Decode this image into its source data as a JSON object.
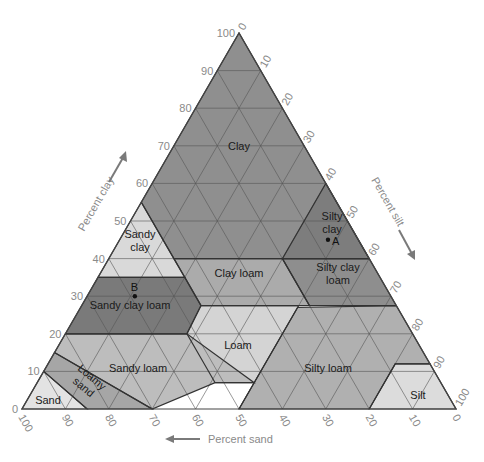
{
  "chart_data": {
    "type": "ternary",
    "title": "",
    "axes": {
      "clay": {
        "label": "Percent clay",
        "direction": "up-left side, arrow upward",
        "ticks": [
          0,
          10,
          20,
          30,
          40,
          50,
          60,
          70,
          80,
          90,
          100
        ]
      },
      "silt": {
        "label": "Percent silt",
        "direction": "right side, arrow downward",
        "ticks": [
          0,
          10,
          20,
          30,
          40,
          50,
          60,
          70,
          80,
          90,
          100
        ]
      },
      "sand": {
        "label": "Percent sand",
        "direction": "bottom, arrow leftward",
        "ticks": [
          100,
          90,
          80,
          70,
          60,
          50,
          40,
          30,
          20,
          10,
          0
        ]
      }
    },
    "grid": true,
    "regions": [
      {
        "name": "Clay",
        "label": "Clay",
        "color": "#8f8f8f",
        "vertices": [
          [
            0,
            0,
            100
          ],
          [
            45,
            0,
            55
          ],
          [
            45,
            15,
            40
          ],
          [
            20,
            40,
            40
          ],
          [
            0,
            60,
            40
          ],
          [
            0,
            0,
            100
          ]
        ],
        "label_pos": [
          30,
          30,
          40
        ],
        "label_at": [
          239,
          146
        ]
      },
      {
        "name": "Sandy clay",
        "label": "Sandy\nclay",
        "color": "#d9d9d9",
        "vertices": [
          [
            45,
            0,
            55
          ],
          [
            65,
            0,
            35
          ],
          [
            45,
            20,
            35
          ],
          [
            45,
            15,
            40
          ]
        ],
        "label_at": [
          140,
          240
        ]
      },
      {
        "name": "Silty clay",
        "label": "Silty\nclay",
        "color": "#7d7d7d",
        "vertices": [
          [
            0,
            60,
            40
          ],
          [
            20,
            40,
            40
          ],
          [
            0,
            40,
            60
          ]
        ],
        "label_at": [
          332,
          222
        ]
      },
      {
        "name": "Sandy clay loam",
        "label": "Sandy clay loam",
        "color": "#7a7a7a",
        "vertices": [
          [
            65,
            0,
            35
          ],
          [
            80,
            0,
            20
          ],
          [
            80,
            0,
            20
          ],
          [
            52,
            28,
            20
          ],
          [
            45,
            27.5,
            27.5
          ],
          [
            45,
            20,
            35
          ]
        ],
        "label_at": [
          130,
          305
        ]
      },
      {
        "name": "Clay loam",
        "label": "Clay loam",
        "color": "#ababab",
        "vertices": [
          [
            45,
            20,
            35
          ],
          [
            45,
            27.5,
            27.5
          ],
          [
            20,
            52.5,
            27.5
          ],
          [
            20,
            40,
            40
          ],
          [
            45,
            15,
            40
          ]
        ],
        "label_at": [
          239,
          273
        ]
      },
      {
        "name": "Silty clay loam",
        "label": "Silty clay\nloam",
        "color": "#8e8e8e",
        "vertices": [
          [
            20,
            40,
            40
          ],
          [
            20,
            52.5,
            27.5
          ],
          [
            0,
            72.5,
            27.5
          ],
          [
            0,
            60,
            40
          ]
        ],
        "label_at": [
          338,
          273
        ]
      },
      {
        "name": "Loam",
        "label": "Loam",
        "color": "#d4d4d4",
        "vertices": [
          [
            52,
            28,
            20
          ],
          [
            45,
            27.5,
            27.5
          ],
          [
            22.5,
            50,
            27.5
          ],
          [
            22.5,
            50,
            27.5
          ],
          [
            23,
            50,
            27
          ],
          [
            50,
            50,
            0
          ],
          [
            43,
            50,
            7
          ],
          [
            52,
            41,
            7
          ]
        ],
        "label_at": [
          238,
          345
        ]
      },
      {
        "name": "Sandy loam",
        "label": "Sandy loam",
        "color": "#bdbdbd",
        "vertices": [
          [
            80,
            0,
            20
          ],
          [
            85,
            0,
            15
          ],
          [
            70,
            30,
            0
          ],
          [
            52,
            41,
            7
          ],
          [
            43,
            50,
            7
          ],
          [
            52,
            28,
            20
          ]
        ],
        "label_at": [
          138,
          368
        ]
      },
      {
        "name": "Silty loam",
        "label": "Silty loam",
        "color": "#b0b0b0",
        "vertices": [
          [
            50,
            50,
            0
          ],
          [
            23,
            50,
            27
          ],
          [
            0,
            72.5,
            27.5
          ],
          [
            0,
            88,
            12
          ],
          [
            8,
            80,
            12
          ],
          [
            20,
            80,
            0
          ]
        ],
        "label_at": [
          328,
          368
        ]
      },
      {
        "name": "Silt",
        "label": "Silt",
        "color": "#dcdcdc",
        "vertices": [
          [
            20,
            80,
            0
          ],
          [
            8,
            80,
            12
          ],
          [
            0,
            88,
            12
          ],
          [
            0,
            100,
            0
          ]
        ],
        "label_at": [
          418,
          395
        ]
      },
      {
        "name": "Loamy sand",
        "label": "Loamy\nsand",
        "color": "#a6a6a6",
        "vertices": [
          [
            85,
            0,
            15
          ],
          [
            90,
            0,
            10
          ],
          [
            85,
            15,
            0
          ],
          [
            70,
            30,
            0
          ]
        ],
        "label_at": [
          88,
          382
        ]
      },
      {
        "name": "Sand",
        "label": "Sand",
        "color": "#e3e3e3",
        "vertices": [
          [
            90,
            0,
            10
          ],
          [
            100,
            0,
            0
          ],
          [
            85,
            15,
            0
          ]
        ],
        "label_at": [
          48,
          400
        ]
      }
    ],
    "points": [
      {
        "label": "A",
        "sand": 7,
        "silt": 48,
        "clay": 45
      },
      {
        "label": "B",
        "sand": 59,
        "silt": 11,
        "clay": 30
      }
    ]
  }
}
